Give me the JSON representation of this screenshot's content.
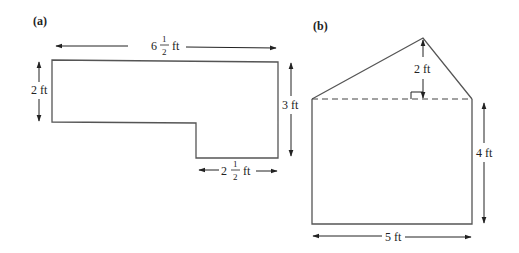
{
  "figure_a": {
    "label": "(a)",
    "dimensions": {
      "top_width": {
        "whole": "6",
        "num": "1",
        "den": "2",
        "unit": "ft"
      },
      "left_height": "2 ft",
      "right_height": "3 ft",
      "bottom_width": {
        "whole": "2",
        "num": "1",
        "den": "2",
        "unit": "ft"
      }
    }
  },
  "figure_b": {
    "label": "(b)",
    "dimensions": {
      "triangle_height": "2 ft",
      "rect_height": "4 ft",
      "rect_width": "5 ft"
    }
  },
  "colors": {
    "line": "#555555",
    "text": "#222222",
    "background": "#ffffff"
  }
}
